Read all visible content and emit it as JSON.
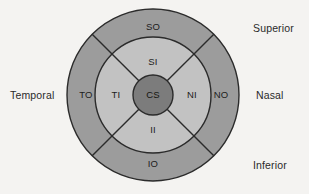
{
  "figure": {
    "type": "concentric-sector-diagram",
    "background_color": "#f4f3f1",
    "geometry": {
      "center_x": 153,
      "center_y": 95,
      "outer_radius": 86,
      "middle_radius": 58,
      "core_radius": 20,
      "sector_divider_angles_deg": [
        45,
        135,
        225,
        315
      ]
    },
    "colors": {
      "outer_ring": "#9c9c9c",
      "middle_ring": "#c2c2c2",
      "core": "#7c7c7c",
      "outline": "#2b2b2b",
      "label_text": "#1c1c1c",
      "side_label_text": "#2a2a2a"
    },
    "rings": [
      {
        "ring_name": "outer",
        "fill": "#9c9c9c",
        "zones": [
          {
            "code": "SO",
            "position": "top",
            "cx": 153,
            "cy": 27
          },
          {
            "code": "NO",
            "position": "right",
            "cx": 221,
            "cy": 95
          },
          {
            "code": "IO",
            "position": "bottom",
            "cx": 153,
            "cy": 164
          },
          {
            "code": "TO",
            "position": "left",
            "cx": 86,
            "cy": 95
          }
        ]
      },
      {
        "ring_name": "middle",
        "fill": "#c2c2c2",
        "zones": [
          {
            "code": "SI",
            "position": "top",
            "cx": 153,
            "cy": 62
          },
          {
            "code": "NI",
            "position": "right",
            "cx": 192,
            "cy": 95
          },
          {
            "code": "II",
            "position": "bottom",
            "cx": 153,
            "cy": 130
          },
          {
            "code": "TI",
            "position": "left",
            "cx": 116,
            "cy": 95
          }
        ]
      },
      {
        "ring_name": "core",
        "fill": "#7c7c7c",
        "zones": [
          {
            "code": "CS",
            "position": "center",
            "cx": 153,
            "cy": 95
          }
        ]
      }
    ],
    "side_labels": [
      {
        "text": "Superior",
        "anchor": "top-right",
        "x": 253,
        "y": 29
      },
      {
        "text": "Nasal",
        "anchor": "middle-right",
        "x": 256,
        "y": 96
      },
      {
        "text": "Inferior",
        "anchor": "bottom-right",
        "x": 253,
        "y": 166
      },
      {
        "text": "Temporal",
        "anchor": "middle-left",
        "x": 10,
        "y": 96
      }
    ]
  }
}
